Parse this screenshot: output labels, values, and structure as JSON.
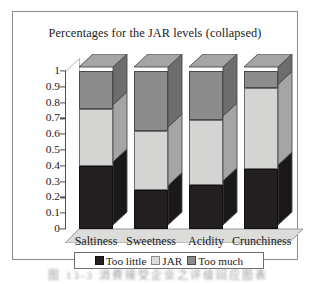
{
  "figure": {
    "caption": "图 13-3  消费接受企业之评级回应图表"
  },
  "chart_data": {
    "type": "bar",
    "stacked": true,
    "orientation": "vertical",
    "three_d": true,
    "title": "Percentages for the JAR levels (collapsed)",
    "xlabel": "",
    "ylabel": "",
    "ylim": [
      0,
      1
    ],
    "ytick_step": 0.1,
    "grid": false,
    "legend_position": "bottom",
    "categories": [
      "Saltiness",
      "Sweetness",
      "Acidity",
      "Crunchiness"
    ],
    "ytick_labels": [
      "1",
      "0.9",
      "0.8",
      "0.7",
      "0.6",
      "0.5",
      "0.4",
      "0.3",
      "0.2",
      "0.1",
      "0"
    ],
    "ytick_values": [
      1,
      0.9,
      0.8,
      0.7,
      0.6,
      0.5,
      0.4,
      0.3,
      0.2,
      0.1,
      0
    ],
    "series": [
      {
        "name": "Too little",
        "color": "#231f20",
        "values": [
          0.4,
          0.25,
          0.28,
          0.38
        ]
      },
      {
        "name": "JAR",
        "color": "#d4d4d2",
        "values": [
          0.36,
          0.37,
          0.41,
          0.51
        ]
      },
      {
        "name": "Too much",
        "color": "#8c8c8c",
        "values": [
          0.24,
          0.38,
          0.31,
          0.11
        ]
      }
    ],
    "cumulative_tops": {
      "Saltiness": [
        0.4,
        0.76,
        1.0
      ],
      "Sweetness": [
        0.25,
        0.62,
        1.0
      ],
      "Acidity": [
        0.28,
        0.69,
        1.0
      ],
      "Crunchiness": [
        0.38,
        0.89,
        1.0
      ]
    }
  }
}
